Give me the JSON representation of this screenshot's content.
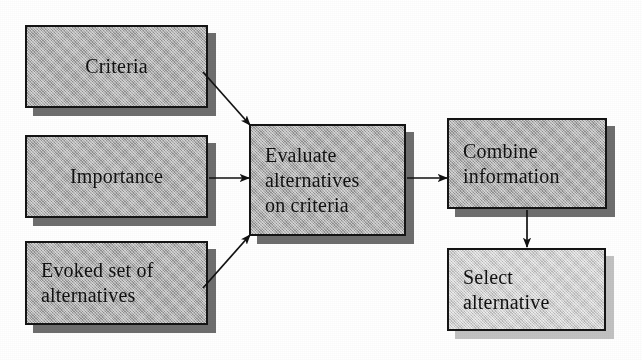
{
  "figure": {
    "type": "flowchart",
    "background": "#ffffff",
    "box_fill_dark": "#a9a9a9",
    "box_fill_light": "#d9d9d9",
    "box_border": "#141414",
    "shadow_dark": "#6e6e6e",
    "shadow_light": "#c2c2c2",
    "text_color": "#111111"
  },
  "nodes": [
    {
      "id": "criteria",
      "label": "Criteria",
      "align": "center",
      "tone": "dark",
      "x": 25,
      "y": 25,
      "w": 183,
      "h": 83
    },
    {
      "id": "importance",
      "label": "Importance",
      "align": "center",
      "tone": "dark",
      "x": 25,
      "y": 135,
      "w": 183,
      "h": 83
    },
    {
      "id": "evoked-set",
      "label": "Evoked set of\nalternatives",
      "align": "left",
      "tone": "dark",
      "x": 25,
      "y": 241,
      "w": 183,
      "h": 84
    },
    {
      "id": "evaluate",
      "label": "Evaluate\nalternatives\non criteria",
      "align": "left",
      "tone": "dark",
      "x": 249,
      "y": 124,
      "w": 157,
      "h": 112
    },
    {
      "id": "combine",
      "label": "Combine\ninformation",
      "align": "left",
      "tone": "dark",
      "x": 447,
      "y": 118,
      "w": 160,
      "h": 91
    },
    {
      "id": "select",
      "label": "Select\nalternative",
      "align": "left",
      "tone": "light",
      "x": 447,
      "y": 248,
      "w": 159,
      "h": 83
    }
  ],
  "arrows": [
    {
      "id": "criteria-to-evaluate",
      "from": "criteria",
      "to": "evaluate",
      "direction": "diagonal-down-right"
    },
    {
      "id": "importance-to-evaluate",
      "from": "importance",
      "to": "evaluate",
      "direction": "right"
    },
    {
      "id": "evoked-to-evaluate",
      "from": "evoked-set",
      "to": "evaluate",
      "direction": "diagonal-up-right"
    },
    {
      "id": "evaluate-to-combine",
      "from": "evaluate",
      "to": "combine",
      "direction": "right"
    },
    {
      "id": "combine-to-select",
      "from": "combine",
      "to": "select",
      "direction": "down"
    }
  ]
}
